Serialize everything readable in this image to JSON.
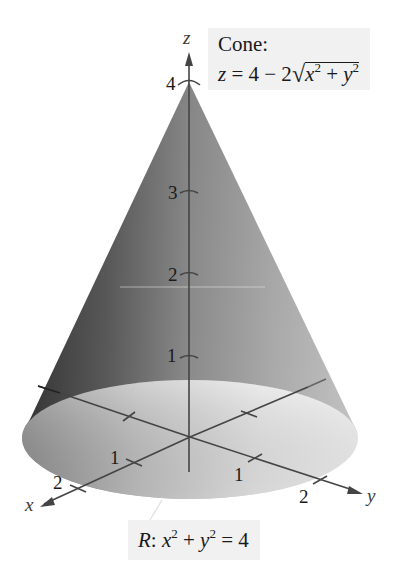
{
  "figure": {
    "surface_label": {
      "title": "Cone:",
      "eq_lhs": "z",
      "eq_mid": " = 4 − 2",
      "eq_rad_x": "x",
      "eq_rad_plus": " + ",
      "eq_rad_y": "y",
      "exp": "2"
    },
    "region_label": {
      "name": "R",
      "colon": ": ",
      "x": "x",
      "plus": " + ",
      "y": "y",
      "rhs": " = 4",
      "exp": "2"
    },
    "axes": {
      "x_label": "x",
      "y_label": "y",
      "z_label": "z"
    },
    "ticks": {
      "z": [
        "1",
        "2",
        "3",
        "4"
      ],
      "x": [
        "1",
        "2"
      ],
      "y": [
        "1",
        "2"
      ]
    },
    "colors": {
      "cone_dark": "#3d3d3d",
      "cone_mid": "#8a8a8a",
      "cone_light": "#bdbdbd",
      "disc_dark": "#9a9a9a",
      "disc_light": "#f2f2f2",
      "axis": "#4a4a4a",
      "label_bg": "#f1f1f1"
    }
  }
}
